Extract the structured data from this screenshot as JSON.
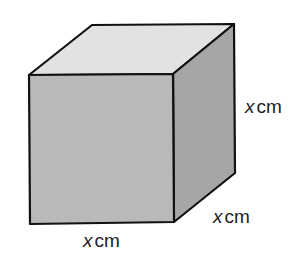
{
  "diagram": {
    "shape": "cube",
    "labels": {
      "height": {
        "variable": "x",
        "unit": "cm"
      },
      "depth": {
        "variable": "x",
        "unit": "cm"
      },
      "width": {
        "variable": "x",
        "unit": "cm"
      }
    },
    "colors": {
      "front_face": "#b9b9b9",
      "top_face": "#e2e2e2",
      "side_face": "#a6a6a6",
      "edge": "#111111"
    }
  }
}
